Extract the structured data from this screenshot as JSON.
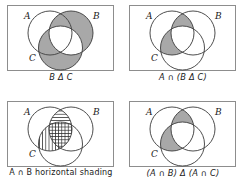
{
  "figure": {
    "type": "venn-diagram-grid",
    "rows": 2,
    "columns": 2,
    "set_labels": [
      "A",
      "B",
      "C"
    ],
    "shade_color": "#a8a8a8",
    "outline_color": "#3a3a3a",
    "frame_color": "#8d8d8d",
    "background_color": "#ffffff"
  },
  "panels": [
    {
      "id": "panel-b-delta-c",
      "caption": "B Δ C",
      "caption_style": "italic",
      "label_a": "A",
      "label_b": "B",
      "label_c": "C",
      "shaded_regions": [
        "B_only",
        "A_and_B_not_C",
        "C_only",
        "A_and_C_not_B"
      ],
      "unshaded_regions": [
        "A_only",
        "B_and_C_not_A",
        "A_and_B_and_C",
        "outside"
      ],
      "fill": "solid-gray"
    },
    {
      "id": "panel-a-cap-b-delta-c",
      "caption": "A ∩ (B Δ C)",
      "caption_style": "italic",
      "label_a": "A",
      "label_b": "B",
      "label_c": "C",
      "shaded_regions": [
        "A_and_B_not_C",
        "A_and_C_not_B"
      ],
      "unshaded_regions": [
        "A_only",
        "B_only",
        "C_only",
        "B_and_C_not_A",
        "A_and_B_and_C",
        "outside"
      ],
      "fill": "solid-gray"
    },
    {
      "id": "panel-a-cap-b-horizontal-shading",
      "caption": "A ∩ B horizontal shading",
      "caption_style": "plain",
      "label_a": "A",
      "label_b": "B",
      "label_c": "C",
      "horizontal_hatch_regions": [
        "A_and_B_not_C",
        "A_and_B_and_C"
      ],
      "vertical_hatch_regions": [
        "A_and_C_not_B",
        "A_and_B_and_C"
      ],
      "crosshatch_regions": [
        "A_and_B_and_C"
      ],
      "fill": "hatched"
    },
    {
      "id": "panel-symmetric-difference-intersections",
      "caption": "(A ∩ B) Δ (A ∩ C)",
      "caption_style": "italic",
      "label_a": "A",
      "label_b": "B",
      "label_c": "C",
      "shaded_regions": [
        "A_and_B_not_C",
        "A_and_C_not_B"
      ],
      "unshaded_regions": [
        "A_only",
        "B_only",
        "C_only",
        "B_and_C_not_A",
        "A_and_B_and_C",
        "outside"
      ],
      "fill": "solid-gray"
    }
  ]
}
